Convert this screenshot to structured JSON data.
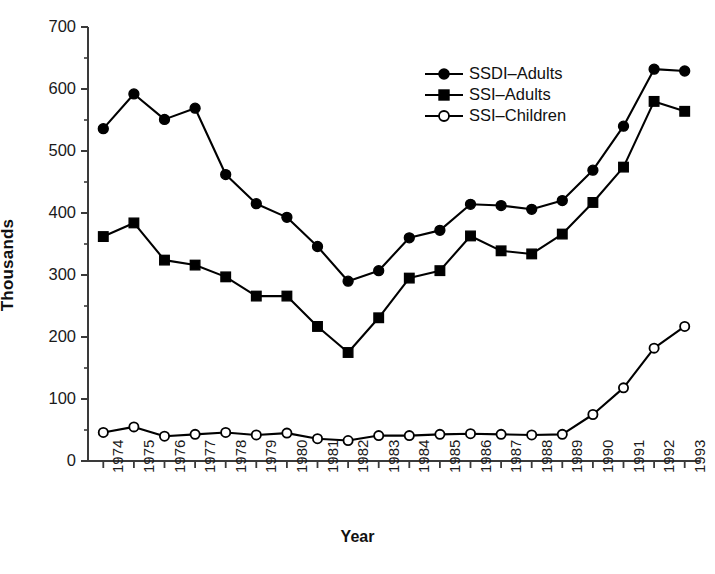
{
  "chart_data": {
    "type": "line",
    "title": "",
    "xlabel": "Year",
    "ylabel": "Thousands",
    "xlim": [
      1974,
      1993
    ],
    "ylim": [
      0,
      700
    ],
    "ytick_labels": [
      "0",
      "100",
      "200",
      "300",
      "400",
      "500",
      "600",
      "700"
    ],
    "yticks": [
      0,
      100,
      200,
      300,
      400,
      500,
      600,
      700
    ],
    "y_minor_ticks": [
      50,
      150,
      250,
      350,
      450,
      550,
      650
    ],
    "grid": false,
    "legend_position": "upper center",
    "categories": [
      1974,
      1975,
      1976,
      1977,
      1978,
      1979,
      1980,
      1981,
      1982,
      1983,
      1984,
      1985,
      1986,
      1987,
      1988,
      1989,
      1990,
      1991,
      1992,
      1993
    ],
    "x": [
      "1974",
      "1975",
      "1976",
      "1977",
      "1978",
      "1979",
      "1980",
      "1981",
      "1982",
      "1983",
      "1984",
      "1985",
      "1986",
      "1987",
      "1988",
      "1989",
      "1990",
      "1991",
      "1992",
      "1993"
    ],
    "series": [
      {
        "name": "SSDI–Adults",
        "marker": "filled-circle",
        "values": [
          536,
          592,
          551,
          569,
          462,
          415,
          393,
          346,
          290,
          307,
          360,
          372,
          414,
          412,
          406,
          420,
          469,
          540,
          632,
          629
        ]
      },
      {
        "name": "SSI–Adults",
        "marker": "filled-square",
        "values": [
          362,
          384,
          324,
          316,
          297,
          266,
          266,
          217,
          175,
          231,
          295,
          307,
          363,
          339,
          334,
          366,
          417,
          474,
          580,
          564
        ]
      },
      {
        "name": "SSI–Children",
        "marker": "open-circle",
        "values": [
          46,
          55,
          40,
          43,
          46,
          42,
          45,
          36,
          33,
          41,
          41,
          43,
          44,
          43,
          42,
          43,
          75,
          118,
          182,
          217
        ]
      }
    ]
  },
  "axes": {
    "y_title": "Thousands",
    "x_title": "Year"
  },
  "legend": {
    "items": [
      {
        "label": "SSDI–Adults",
        "marker": "filled-circle"
      },
      {
        "label": "SSI–Adults",
        "marker": "filled-square"
      },
      {
        "label": "SSI–Children",
        "marker": "open-circle"
      }
    ]
  },
  "caption": {
    "text": ""
  },
  "colors": {
    "line": "#000000",
    "marker_fill": "#000000",
    "marker_open_fill": "#ffffff",
    "axis": "#3a3a3a",
    "background": "#ffffff"
  }
}
